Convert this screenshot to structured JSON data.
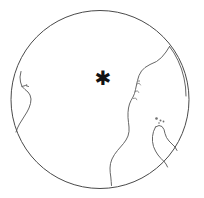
{
  "figure": {
    "type": "orthographic-globe-map",
    "background_color": "#ffffff",
    "width": 204,
    "height": 198
  },
  "globe": {
    "limb_label": "globe outline",
    "center_x": 100,
    "center_y": 99.5,
    "radius": 89,
    "stroke_color": "#4a4a4a",
    "fill_color": "#ffffff"
  },
  "marker": {
    "glyph": "✱",
    "label": "location-marker",
    "x": 103,
    "y": 78,
    "color": "#121212"
  },
  "coastlines": {
    "stroke_color": "#555555",
    "features": [
      {
        "name": "eastern-continent-coast",
        "path": "M 169.5 46.5 L 166 52 L 161.5 57.5 L 156.5 61.5 L 150 64.5 L 145 67.5 L 141.5 71 L 139 75.5 L 137.5 80.5 L 136.5 85 L 135.5 89.5 L 134.5 93.5 L 133 97 L 131 100.5 L 129.5 104 L 128.5 108 L 128 112.5 L 128 117.5 L 128.5 122.5 L 129 127 L 129 131.5 L 128 136 L 126 140 L 123.5 143.5 L 120.5 147 L 117.5 150.5 L 114.5 154.5 L 112 159 L 110.5 163.5 L 110 168 L 110.2 172.5 L 110.8 177 L 111.2 181.5 L 111.5 185.5"
      },
      {
        "name": "eastern-continent-north-limb",
        "path": "M 169.5 46.5 L 174 53 L 178 60.5 L 181.5 69 L 184 78 L 185.5 87 L 186 96"
      },
      {
        "name": "western-sliver-coast",
        "path": "M 21 71.5 L 20 77 L 20.5 82 L 22 86.5 L 25 89.5 L 28 92 L 30 95 L 31 99 L 30.5 103.5 L 29 108 L 27 112 L 24.5 116 L 22 120 L 19.5 124 L 17.5 128 L 16 132"
      },
      {
        "name": "western-sliver-inlet",
        "path": "M 22 86.5 L 25.5 85.5 L 28.5 86.5"
      },
      {
        "name": "southeast-island-arc-west",
        "path": "M 155.5 127 L 153.5 131.5 L 152.5 136.5 L 152.5 141.5 L 153.5 146.5 L 155.5 151 L 158 155 L 161 158.5 L 164 161.5"
      },
      {
        "name": "southeast-island-arc-east",
        "path": "M 155.5 127 L 159 125.5 L 162 126.5 L 164 129.5 L 165 133.5 L 166.5 137.5 L 169 141 L 172 144 L 175 147 L 177 150.5"
      },
      {
        "name": "southeast-island-tip",
        "path": "M 164 161.5 L 166 164 L 167.5 167"
      }
    ]
  },
  "coast_details": [
    {
      "name": "bay-notch-upper",
      "path": "M 136.8 84 L 139.2 83.2 L 140.5 85"
    },
    {
      "name": "bay-notch-mid",
      "path": "M 135.2 91.5 L 137.5 90.8 L 138.8 92.6"
    },
    {
      "name": "bay-notch-lower",
      "path": "M 133.4 98.5 L 135.6 98 L 136.8 99.8"
    }
  ],
  "islets": [
    {
      "name": "islet-1",
      "x": 156.5,
      "y": 118.5,
      "r": 1.3
    },
    {
      "name": "islet-2",
      "x": 160.5,
      "y": 120.5,
      "r": 1.0
    },
    {
      "name": "islet-3",
      "x": 163.5,
      "y": 121.5,
      "r": 0.9
    },
    {
      "name": "islet-4",
      "x": 159.0,
      "y": 123.0,
      "r": 0.8
    },
    {
      "name": "islet-5",
      "x": 139.0,
      "y": 81.0,
      "r": 0.8
    },
    {
      "name": "islet-6",
      "x": 26.5,
      "y": 85.0,
      "r": 0.8
    }
  ]
}
